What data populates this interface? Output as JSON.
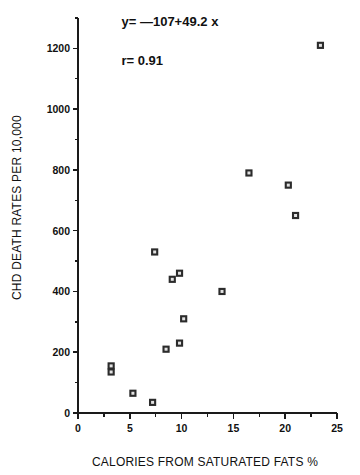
{
  "chart_data": {
    "type": "scatter",
    "title": "",
    "xlabel": "CALORIES FROM SATURATED FATS %",
    "ylabel": "CHD DEATH RATES PER 10,000",
    "xlim": [
      0,
      25
    ],
    "ylim": [
      0,
      1300
    ],
    "xticks": [
      0,
      5,
      10,
      15,
      20,
      25
    ],
    "xticklabels": [
      "0",
      "5",
      "10",
      "15",
      "20",
      "25"
    ],
    "yticks": [
      0,
      200,
      400,
      600,
      800,
      1000,
      1200
    ],
    "yticklabels": [
      "0",
      "200",
      "400",
      "600",
      "800",
      "1000",
      "1200"
    ],
    "y_minor_ticks": [
      100,
      300,
      500,
      700,
      900,
      1100,
      1300
    ],
    "x_minor_ticks": [
      2.5,
      7.5,
      12.5,
      17.5,
      22.5
    ],
    "grid": false,
    "legend": null,
    "marker": "open-square",
    "points": [
      {
        "x": 3.2,
        "y": 155
      },
      {
        "x": 3.2,
        "y": 135
      },
      {
        "x": 5.3,
        "y": 65
      },
      {
        "x": 7.2,
        "y": 35
      },
      {
        "x": 7.4,
        "y": 530
      },
      {
        "x": 8.5,
        "y": 210
      },
      {
        "x": 9.1,
        "y": 440
      },
      {
        "x": 9.8,
        "y": 460
      },
      {
        "x": 9.8,
        "y": 230
      },
      {
        "x": 10.2,
        "y": 310
      },
      {
        "x": 13.9,
        "y": 400
      },
      {
        "x": 16.5,
        "y": 790
      },
      {
        "x": 20.3,
        "y": 750
      },
      {
        "x": 21.0,
        "y": 650
      },
      {
        "x": 23.4,
        "y": 1210
      }
    ],
    "annotations": [
      {
        "name": "regression-equation",
        "text": "y= —107+49.2  x",
        "x": 4.2,
        "y": 1275
      },
      {
        "name": "correlation-coefficient",
        "text": "r=    0.91",
        "x": 4.2,
        "y": 1145
      }
    ],
    "fit": {
      "intercept": -107,
      "slope": 49.2,
      "r": 0.91,
      "drawn": false
    }
  },
  "colors": {
    "axis": "#1a1a1a",
    "marker_edge": "#2b2b2b",
    "marker_face": "#e2e2e2",
    "background": "#ffffff",
    "text": "#111111"
  }
}
